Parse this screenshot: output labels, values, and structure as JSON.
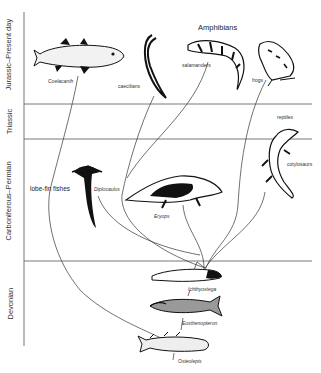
{
  "diagram": {
    "title": "Amphibians",
    "periods": [
      {
        "label": "Jurassic–Present day"
      },
      {
        "label": "Triassic"
      },
      {
        "label": "Carboniferous–Permian"
      },
      {
        "label": "Devonian"
      }
    ],
    "group_labels": {
      "amphibians": "Amphibians",
      "lobe_fin": "lobe-fin fishes",
      "reptiles": "reptiles"
    },
    "taxa": {
      "coelacanth": "Coelacanth",
      "caecilians": "caecilians",
      "salamanders": "salamanders",
      "frogs": "frogs",
      "diplocaulus": "Diplocaulus",
      "eryops": "Eryops",
      "cotylosaurs": "cotylosaurs",
      "ichthyostega": "Ichthyostega",
      "eusthenopteron": "Eusthenopteron",
      "osteolepis": "Osteolepis"
    },
    "colors": {
      "line": "#333333",
      "ink": "#111111",
      "axis": "#555555"
    }
  }
}
